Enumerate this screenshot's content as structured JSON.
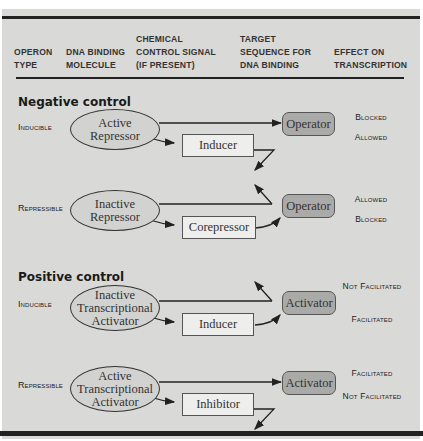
{
  "header": {
    "columns": [
      {
        "line1": "",
        "line2": "OPERON",
        "line3": "TYPE"
      },
      {
        "line1": "",
        "line2": "DNA BINDING",
        "line3": "MOLECULE"
      },
      {
        "line1": "CHEMICAL",
        "line2": "CONTROL SIGNAL",
        "line3": "(IF PRESENT)"
      },
      {
        "line1": "TARGET",
        "line2": "SEQUENCE FOR",
        "line3": "DNA BINDING"
      },
      {
        "line1": "",
        "line2": "EFFECT ON",
        "line3": "TRANSCRIPTION"
      }
    ]
  },
  "sections": [
    {
      "title": "Negative control",
      "rows": [
        {
          "operon_type": "Inducible",
          "binding_molecule": [
            "Active",
            "Repressor"
          ],
          "signal": "Inducer",
          "target": "Operator",
          "effects": [
            "Blocked",
            "Allowed"
          ]
        },
        {
          "operon_type": "Repressible",
          "binding_molecule": [
            "Inactive",
            "Repressor"
          ],
          "signal": "Corepressor",
          "target": "Operator",
          "effects": [
            "Allowed",
            "Blocked"
          ]
        }
      ]
    },
    {
      "title": "Positive control",
      "rows": [
        {
          "operon_type": "Inducible",
          "binding_molecule": [
            "Inactive",
            "Transcriptional",
            "Activator"
          ],
          "signal": "Inducer",
          "target": "Activator",
          "effects": [
            "Not Facilitated",
            "Facilitated"
          ]
        },
        {
          "operon_type": "Repressible",
          "binding_molecule": [
            "Active",
            "Transcriptional",
            "Activator"
          ],
          "signal": "Inhibitor",
          "target": "Activator",
          "effects": [
            "Facilitated",
            "Not Facilitated"
          ]
        }
      ]
    }
  ],
  "colors": {
    "panel_bg": "#d9d9d7",
    "target_box": "#aaaaa8",
    "signal_box": "#eeeeec",
    "rule": "#222222"
  }
}
